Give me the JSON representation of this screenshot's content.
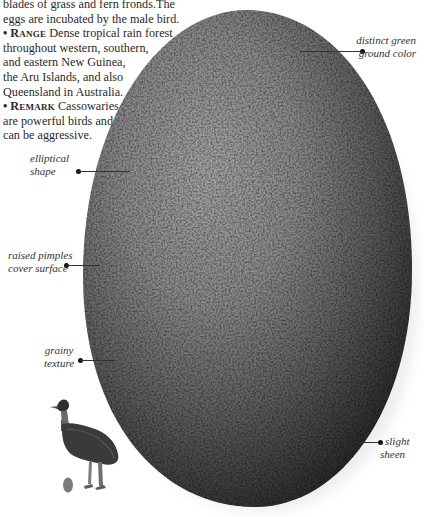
{
  "body_text": {
    "lines": [
      "blades of grass and fern fronds.The",
      "eggs are incubated by the male bird."
    ],
    "range": {
      "bullet": "•",
      "keyword": "Range",
      "lines": [
        "Dense tropical rain forest",
        "throughout western, southern,",
        "and eastern New Guinea,",
        "the Aru Islands, and also",
        "Queensland in Australia."
      ]
    },
    "remark": {
      "bullet": "•",
      "keyword": "Remark",
      "lines": [
        "Cassowaries",
        "are powerful birds and",
        "can be aggressive."
      ]
    }
  },
  "annotations": [
    {
      "id": "distinct-green",
      "line1": "distinct green",
      "line2": "ground color"
    },
    {
      "id": "elliptical",
      "line1": "elliptical",
      "line2": "shape"
    },
    {
      "id": "raised-pimples",
      "line1": "raised pimples",
      "line2": "cover surface"
    },
    {
      "id": "grainy",
      "line1": "grainy",
      "line2": "texture"
    },
    {
      "id": "sheen",
      "line1": "slight",
      "line2": "sheen"
    }
  ],
  "illustration": {
    "subject": "cassowary egg",
    "inset": "cassowary bird with egg for scale",
    "colors": {
      "egg_light": "#9a9a9a",
      "egg_mid": "#6e6e6e",
      "egg_dark": "#2a2a2a",
      "bird_body": "#3a3a3a",
      "small_egg": "#7a7a7a"
    }
  }
}
